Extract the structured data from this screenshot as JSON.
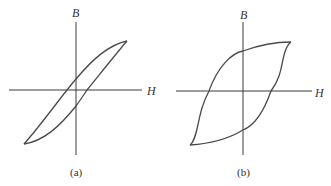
{
  "figure": {
    "panels": [
      {
        "id": "a",
        "caption": "(a)",
        "x_axis_label": "H",
        "y_axis_label": "B",
        "description": "Narrow hysteresis loop (soft magnetic material)"
      },
      {
        "id": "b",
        "caption": "(b)",
        "x_axis_label": "H",
        "y_axis_label": "B",
        "description": "Wide hysteresis loop (hard magnetic material)"
      }
    ]
  },
  "colors": {
    "line": "#4a4a4a",
    "axis": "#3a3a3a",
    "background": "#ffffff"
  }
}
